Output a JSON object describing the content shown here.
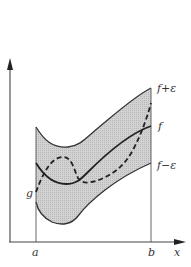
{
  "diagram": {
    "type": "epsilon-tube approximation",
    "labels": {
      "upper_band": "f+ε",
      "function": "f",
      "lower_band": "f−ε",
      "approximant": "g",
      "left_endpoint": "a",
      "right_endpoint": "b",
      "x_axis": "x"
    },
    "colors": {
      "band_fill": "#c8c8c8",
      "curve": "#222222",
      "axis": "#444444",
      "background": "#ffffff"
    }
  }
}
